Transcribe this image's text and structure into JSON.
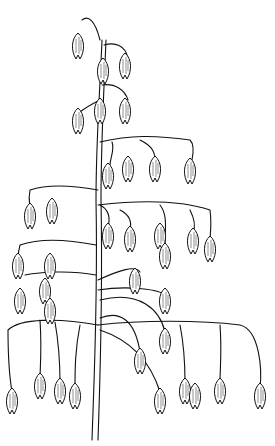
{
  "image": {
    "subject": "oat plant panicle line drawing",
    "style": "black ink line art on white",
    "colors": {
      "background": "#ffffff",
      "ink": "#111111"
    }
  },
  "caption": "",
  "spikelets": [
    [
      78,
      45
    ],
    [
      103,
      70
    ],
    [
      125,
      65
    ],
    [
      78,
      120
    ],
    [
      100,
      110
    ],
    [
      125,
      110
    ],
    [
      30,
      215
    ],
    [
      52,
      210
    ],
    [
      108,
      175
    ],
    [
      128,
      168
    ],
    [
      155,
      168
    ],
    [
      190,
      170
    ],
    [
      108,
      235
    ],
    [
      130,
      238
    ],
    [
      160,
      235
    ],
    [
      165,
      255
    ],
    [
      193,
      240
    ],
    [
      210,
      248
    ],
    [
      18,
      265
    ],
    [
      50,
      265
    ],
    [
      20,
      300
    ],
    [
      45,
      290
    ],
    [
      50,
      310
    ],
    [
      135,
      280
    ],
    [
      165,
      300
    ],
    [
      12,
      400
    ],
    [
      40,
      385
    ],
    [
      60,
      390
    ],
    [
      75,
      395
    ],
    [
      160,
      400
    ],
    [
      185,
      390
    ],
    [
      195,
      395
    ],
    [
      220,
      390
    ],
    [
      260,
      395
    ],
    [
      140,
      360
    ],
    [
      165,
      340
    ]
  ]
}
